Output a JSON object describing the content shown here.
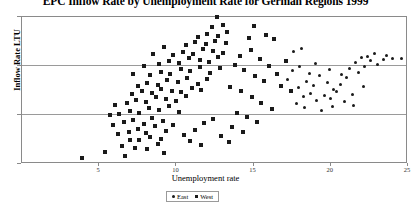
{
  "chart_data": {
    "type": "scatter",
    "title": "EPC Inflow Rate by Unemployment Rate for German Regions 1999",
    "xlabel": "Unemployment rate",
    "ylabel": "Inflow Rate LTU",
    "xlim": [
      0,
      25
    ],
    "ylim": [
      5,
      20
    ],
    "xticks": [
      5,
      10,
      15,
      20,
      25
    ],
    "yticks": [
      0,
      5,
      10,
      15,
      20
    ],
    "grid": true,
    "legend_position": "bottom-center",
    "series": [
      {
        "name": "West",
        "marker": "square",
        "color": "#1a1a1a",
        "points": [
          [
            3.9,
            5.6
          ],
          [
            5.4,
            6.2
          ],
          [
            6.7,
            5.8
          ],
          [
            9.2,
            6.1
          ],
          [
            6.5,
            6.8
          ],
          [
            7.3,
            6.6
          ],
          [
            8.1,
            6.5
          ],
          [
            8.8,
            7.0
          ],
          [
            7.0,
            7.5
          ],
          [
            7.6,
            7.4
          ],
          [
            8.3,
            7.8
          ],
          [
            9.0,
            7.6
          ],
          [
            6.2,
            8.1
          ],
          [
            6.9,
            8.3
          ],
          [
            7.5,
            8.6
          ],
          [
            8.0,
            8.2
          ],
          [
            8.6,
            8.9
          ],
          [
            9.3,
            8.4
          ],
          [
            5.9,
            9.0
          ],
          [
            6.6,
            9.3
          ],
          [
            7.2,
            9.5
          ],
          [
            7.9,
            9.1
          ],
          [
            8.4,
            9.7
          ],
          [
            9.1,
            9.4
          ],
          [
            9.8,
            9.0
          ],
          [
            6.3,
            10.1
          ],
          [
            7.0,
            10.4
          ],
          [
            7.6,
            10.2
          ],
          [
            8.2,
            10.7
          ],
          [
            8.9,
            10.5
          ],
          [
            9.5,
            10.9
          ],
          [
            10.2,
            10.3
          ],
          [
            6.8,
            11.2
          ],
          [
            7.4,
            11.5
          ],
          [
            8.0,
            11.3
          ],
          [
            8.7,
            11.8
          ],
          [
            9.3,
            11.6
          ],
          [
            10.0,
            11.4
          ],
          [
            10.6,
            11.9
          ],
          [
            7.1,
            12.1
          ],
          [
            7.8,
            12.4
          ],
          [
            8.4,
            12.2
          ],
          [
            9.0,
            12.7
          ],
          [
            9.7,
            12.5
          ],
          [
            10.3,
            12.3
          ],
          [
            11.0,
            12.8
          ],
          [
            11.6,
            12.6
          ],
          [
            7.5,
            13.0
          ],
          [
            8.1,
            13.3
          ],
          [
            8.8,
            13.1
          ],
          [
            9.4,
            13.6
          ],
          [
            10.1,
            13.4
          ],
          [
            10.7,
            13.8
          ],
          [
            11.4,
            13.2
          ],
          [
            12.0,
            13.7
          ],
          [
            8.3,
            14.1
          ],
          [
            9.0,
            14.4
          ],
          [
            9.6,
            14.2
          ],
          [
            10.3,
            14.7
          ],
          [
            10.9,
            14.5
          ],
          [
            11.5,
            14.9
          ],
          [
            12.2,
            14.3
          ],
          [
            12.8,
            14.8
          ],
          [
            8.9,
            15.2
          ],
          [
            9.5,
            15.5
          ],
          [
            10.2,
            15.3
          ],
          [
            10.8,
            15.8
          ],
          [
            11.5,
            15.6
          ],
          [
            12.1,
            15.4
          ],
          [
            12.7,
            15.9
          ],
          [
            9.8,
            16.1
          ],
          [
            10.4,
            16.4
          ],
          [
            11.1,
            16.2
          ],
          [
            11.7,
            16.7
          ],
          [
            12.4,
            16.5
          ],
          [
            13.0,
            16.3
          ],
          [
            10.6,
            17.1
          ],
          [
            11.2,
            17.4
          ],
          [
            11.9,
            17.2
          ],
          [
            12.5,
            17.6
          ],
          [
            13.2,
            17.3
          ],
          [
            11.4,
            18.0
          ],
          [
            12.0,
            18.3
          ],
          [
            12.7,
            18.1
          ],
          [
            13.3,
            18.5
          ],
          [
            12.3,
            19.0
          ],
          [
            13.0,
            19.2
          ],
          [
            12.6,
            20.0
          ],
          [
            13.8,
            15.1
          ],
          [
            14.4,
            14.6
          ],
          [
            15.1,
            14.0
          ],
          [
            15.7,
            13.5
          ],
          [
            14.1,
            16.0
          ],
          [
            14.8,
            16.6
          ],
          [
            15.4,
            15.7
          ],
          [
            16.0,
            15.0
          ],
          [
            13.5,
            12.9
          ],
          [
            14.2,
            12.4
          ],
          [
            14.9,
            11.8
          ],
          [
            15.5,
            11.2
          ],
          [
            16.2,
            10.6
          ],
          [
            13.9,
            10.2
          ],
          [
            14.6,
            9.8
          ],
          [
            15.2,
            9.3
          ],
          [
            16.8,
            13.0
          ],
          [
            17.4,
            12.5
          ],
          [
            16.5,
            14.2
          ],
          [
            17.1,
            15.5
          ],
          [
            5.7,
            10.0
          ],
          [
            6.0,
            11.0
          ],
          [
            10.5,
            8.0
          ],
          [
            11.2,
            8.5
          ],
          [
            11.8,
            9.2
          ],
          [
            12.4,
            9.6
          ],
          [
            10.9,
            7.3
          ],
          [
            11.6,
            6.9
          ],
          [
            9.2,
            16.9
          ],
          [
            8.5,
            16.2
          ],
          [
            7.9,
            15.0
          ],
          [
            7.2,
            14.2
          ],
          [
            13.6,
            8.8
          ],
          [
            14.3,
            8.3
          ],
          [
            12.9,
            7.9
          ],
          [
            13.4,
            7.2
          ],
          [
            16.3,
            17.8
          ],
          [
            15.8,
            18.2
          ],
          [
            14.7,
            17.9
          ],
          [
            15.0,
            19.1
          ]
        ]
      },
      {
        "name": "East",
        "marker": "circle",
        "color": "#1a1a1a",
        "points": [
          [
            17.9,
            12.8
          ],
          [
            18.4,
            13.4
          ],
          [
            18.9,
            13.0
          ],
          [
            19.3,
            14.0
          ],
          [
            19.8,
            13.3
          ],
          [
            20.2,
            12.6
          ],
          [
            20.6,
            13.1
          ],
          [
            21.0,
            13.8
          ],
          [
            18.2,
            11.9
          ],
          [
            18.7,
            12.2
          ],
          [
            19.1,
            11.5
          ],
          [
            19.6,
            12.0
          ],
          [
            20.0,
            11.7
          ],
          [
            20.4,
            12.4
          ],
          [
            20.9,
            11.4
          ],
          [
            21.4,
            12.1
          ],
          [
            21.8,
            14.3
          ],
          [
            22.2,
            14.9
          ],
          [
            22.6,
            15.6
          ],
          [
            23.0,
            15.2
          ],
          [
            22.0,
            15.9
          ],
          [
            22.4,
            16.0
          ],
          [
            21.6,
            15.4
          ],
          [
            23.4,
            15.7
          ],
          [
            24.0,
            15.8
          ],
          [
            24.6,
            15.8
          ],
          [
            23.6,
            16.1
          ],
          [
            22.8,
            16.3
          ],
          [
            17.5,
            14.5
          ],
          [
            18.0,
            15.0
          ],
          [
            17.2,
            13.6
          ],
          [
            19.0,
            15.3
          ],
          [
            19.9,
            14.6
          ],
          [
            20.7,
            14.1
          ],
          [
            21.2,
            14.7
          ],
          [
            18.6,
            14.2
          ],
          [
            17.8,
            11.2
          ],
          [
            18.3,
            10.8
          ],
          [
            19.4,
            10.5
          ],
          [
            20.1,
            10.9
          ],
          [
            21.5,
            11.0
          ],
          [
            22.1,
            12.9
          ],
          [
            17.6,
            16.5
          ],
          [
            18.1,
            16.8
          ]
        ]
      }
    ]
  },
  "legend": {
    "entries": [
      {
        "label": "East"
      },
      {
        "label": "West"
      }
    ]
  }
}
